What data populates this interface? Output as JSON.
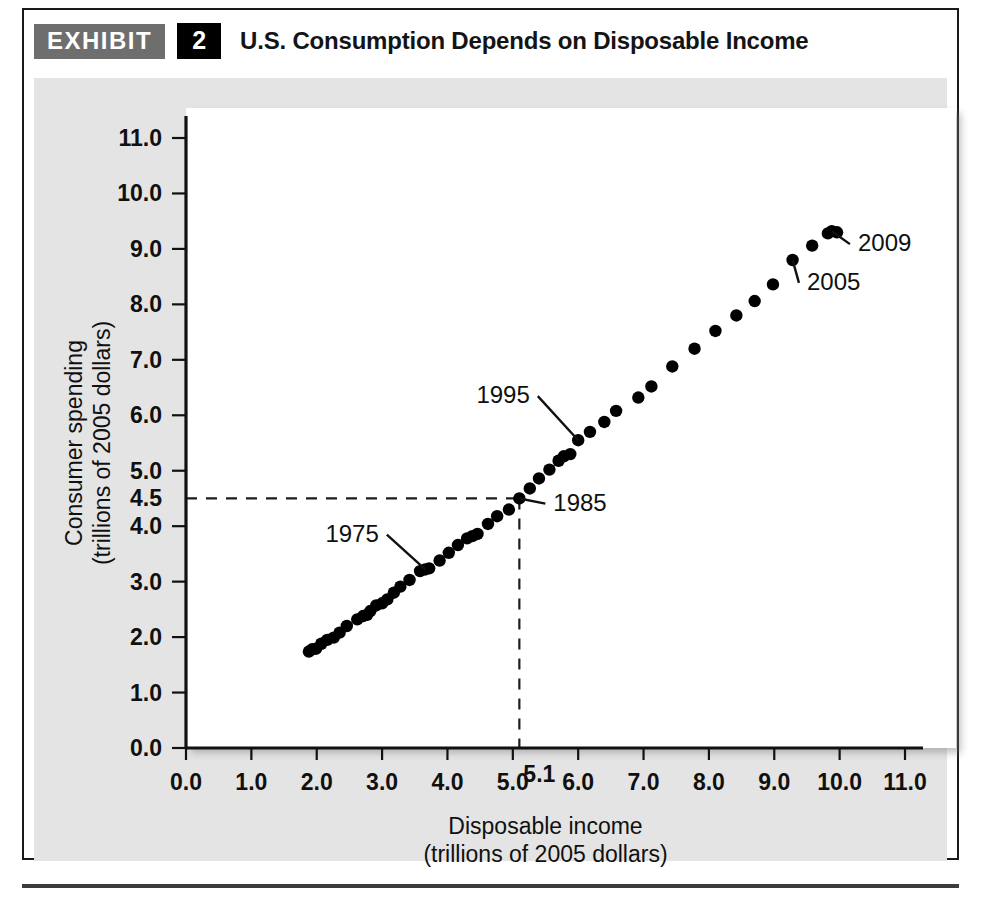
{
  "exhibit": {
    "tag": "EXHIBIT",
    "number": "2",
    "title": "U.S. Consumption Depends on Disposable Income"
  },
  "chart_data": {
    "type": "scatter",
    "title": "U.S. Consumption Depends on Disposable Income",
    "xlabel": "Disposable income",
    "xlabel_units": "(trillions of 2005 dollars)",
    "ylabel": "Consumer spending",
    "ylabel_units": "(trillions of 2005 dollars)",
    "xlim": [
      0.0,
      11.0
    ],
    "ylim": [
      0.0,
      11.0
    ],
    "grid": false,
    "legend": "none",
    "xticks": [
      "0.0",
      "1.0",
      "2.0",
      "3.0",
      "4.0",
      "5.0",
      "6.0",
      "7.0",
      "8.0",
      "9.0",
      "10.0",
      "11.0"
    ],
    "yticks": [
      "0.0",
      "1.0",
      "2.0",
      "3.0",
      "4.0",
      "5.0",
      "6.0",
      "7.0",
      "8.0",
      "9.0",
      "10.0",
      "11.0"
    ],
    "xtick_values": [
      0,
      1,
      2,
      3,
      4,
      5,
      6,
      7,
      8,
      9,
      10,
      11
    ],
    "ytick_values": [
      0,
      1,
      2,
      3,
      4,
      5,
      6,
      7,
      8,
      9,
      10,
      11
    ],
    "reference_lines": {
      "x_value": 5.1,
      "x_label": "5.1",
      "y_value": 4.5,
      "y_label": "4.5",
      "style": "dashed",
      "meets_at_point_label": "1985"
    },
    "annotations": [
      {
        "label": "1975",
        "x": 3.66,
        "y": 3.22,
        "text_x": 2.95,
        "text_y": 3.72
      },
      {
        "label": "1985",
        "x": 5.1,
        "y": 4.5,
        "text_x": 5.62,
        "text_y": 4.28
      },
      {
        "label": "1995",
        "x": 6.0,
        "y": 5.55,
        "text_x": 5.26,
        "text_y": 6.22
      },
      {
        "label": "2005",
        "x": 9.28,
        "y": 8.8,
        "text_x": 9.5,
        "text_y": 8.26
      },
      {
        "label": "2009",
        "x": 9.88,
        "y": 9.32,
        "text_x": 10.28,
        "text_y": 8.96
      }
    ],
    "series": [
      {
        "name": "Disposable income vs. consumer spending, 1965-2009",
        "marker": "circle",
        "color": "#000000",
        "points": [
          {
            "x": 1.88,
            "y": 1.74
          },
          {
            "x": 1.93,
            "y": 1.78
          },
          {
            "x": 1.99,
            "y": 1.79
          },
          {
            "x": 2.07,
            "y": 1.88
          },
          {
            "x": 2.16,
            "y": 1.95
          },
          {
            "x": 2.26,
            "y": 1.99
          },
          {
            "x": 2.35,
            "y": 2.08
          },
          {
            "x": 2.46,
            "y": 2.2
          },
          {
            "x": 2.62,
            "y": 2.32
          },
          {
            "x": 2.71,
            "y": 2.38
          },
          {
            "x": 2.77,
            "y": 2.4
          },
          {
            "x": 2.82,
            "y": 2.47
          },
          {
            "x": 2.91,
            "y": 2.57
          },
          {
            "x": 3.0,
            "y": 2.61
          },
          {
            "x": 3.08,
            "y": 2.68
          },
          {
            "x": 3.18,
            "y": 2.8
          },
          {
            "x": 3.28,
            "y": 2.91
          },
          {
            "x": 3.42,
            "y": 3.03
          },
          {
            "x": 3.58,
            "y": 3.19
          },
          {
            "x": 3.66,
            "y": 3.22
          },
          {
            "x": 3.72,
            "y": 3.24
          },
          {
            "x": 3.88,
            "y": 3.38
          },
          {
            "x": 4.02,
            "y": 3.52
          },
          {
            "x": 4.16,
            "y": 3.66
          },
          {
            "x": 4.3,
            "y": 3.78
          },
          {
            "x": 4.38,
            "y": 3.82
          },
          {
            "x": 4.46,
            "y": 3.86
          },
          {
            "x": 4.62,
            "y": 4.04
          },
          {
            "x": 4.76,
            "y": 4.18
          },
          {
            "x": 4.94,
            "y": 4.3
          },
          {
            "x": 5.1,
            "y": 4.5
          },
          {
            "x": 5.26,
            "y": 4.68
          },
          {
            "x": 5.4,
            "y": 4.86
          },
          {
            "x": 5.56,
            "y": 5.02
          },
          {
            "x": 5.7,
            "y": 5.18
          },
          {
            "x": 5.78,
            "y": 5.26
          },
          {
            "x": 5.88,
            "y": 5.3
          },
          {
            "x": 6.0,
            "y": 5.55
          },
          {
            "x": 6.18,
            "y": 5.7
          },
          {
            "x": 6.4,
            "y": 5.88
          },
          {
            "x": 6.58,
            "y": 6.08
          },
          {
            "x": 6.92,
            "y": 6.32
          },
          {
            "x": 7.12,
            "y": 6.52
          },
          {
            "x": 7.44,
            "y": 6.88
          },
          {
            "x": 7.78,
            "y": 7.2
          },
          {
            "x": 8.1,
            "y": 7.52
          },
          {
            "x": 8.42,
            "y": 7.8
          },
          {
            "x": 8.7,
            "y": 8.06
          },
          {
            "x": 8.98,
            "y": 8.36
          },
          {
            "x": 9.28,
            "y": 8.8
          },
          {
            "x": 9.58,
            "y": 9.06
          },
          {
            "x": 9.82,
            "y": 9.28
          },
          {
            "x": 9.88,
            "y": 9.32
          },
          {
            "x": 9.96,
            "y": 9.3
          }
        ]
      }
    ]
  }
}
